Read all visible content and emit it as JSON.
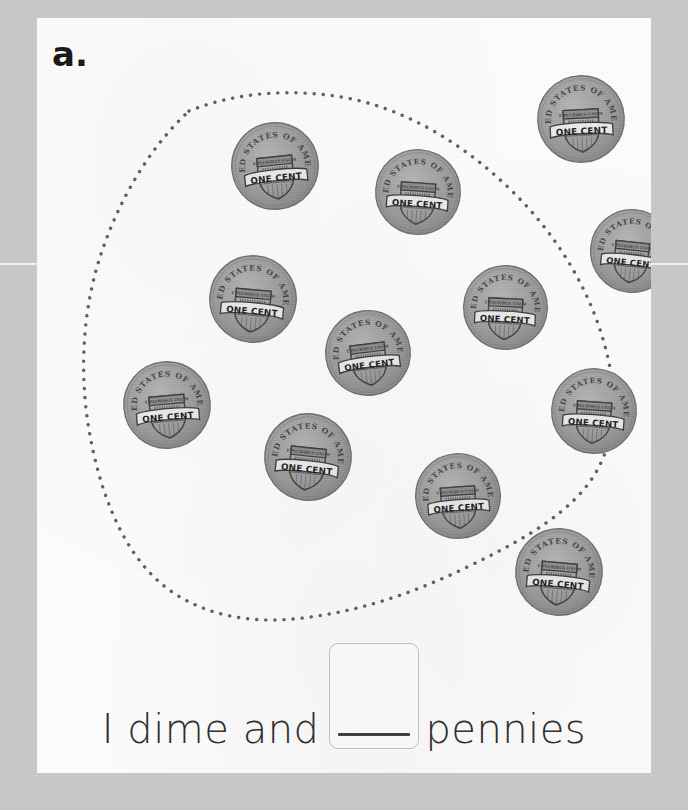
{
  "worksheet": {
    "item_label": "a.",
    "background_color": "#c8c8c8",
    "card_color": "#fdfdfd"
  },
  "grouping_loop": {
    "name": "dotted-grouping-loop",
    "style": "dotted",
    "dot_color": "#5d5d5d",
    "encloses_count": 10
  },
  "coins": {
    "denomination": "penny",
    "face": "reverse",
    "legend_top": "UNITED STATES OF AMERICA",
    "legend_shield": "E PLURIBUS UNUM",
    "legend_banner": "ONE CENT",
    "fill_color": "#9a9a9a",
    "ink_color": "#3c3c3c",
    "total_count": 12,
    "inside_loop_count": 10,
    "outside_loop_count": 2,
    "placements": [
      {
        "id": "coin-1",
        "x": 192,
        "y": 102,
        "size": 92,
        "rotate": -6,
        "inside_loop": true
      },
      {
        "id": "coin-2",
        "x": 336,
        "y": 129,
        "size": 90,
        "rotate": 4,
        "inside_loop": true
      },
      {
        "id": "coin-3",
        "x": 498,
        "y": 55,
        "size": 92,
        "rotate": -3,
        "inside_loop": false
      },
      {
        "id": "coin-4",
        "x": 551,
        "y": 189,
        "size": 88,
        "rotate": 6,
        "inside_loop": false
      },
      {
        "id": "coin-5",
        "x": 170,
        "y": 235,
        "size": 92,
        "rotate": 5,
        "inside_loop": true
      },
      {
        "id": "coin-6",
        "x": 286,
        "y": 290,
        "size": 90,
        "rotate": -7,
        "inside_loop": true
      },
      {
        "id": "coin-7",
        "x": 424,
        "y": 245,
        "size": 89,
        "rotate": 3,
        "inside_loop": true
      },
      {
        "id": "coin-8",
        "x": 84,
        "y": 341,
        "size": 92,
        "rotate": -5,
        "inside_loop": true
      },
      {
        "id": "coin-9",
        "x": 512,
        "y": 348,
        "size": 90,
        "rotate": 4,
        "inside_loop": true
      },
      {
        "id": "coin-10",
        "x": 225,
        "y": 393,
        "size": 92,
        "rotate": 6,
        "inside_loop": true
      },
      {
        "id": "coin-11",
        "x": 376,
        "y": 433,
        "size": 90,
        "rotate": -4,
        "inside_loop": true
      },
      {
        "id": "coin-12",
        "x": 476,
        "y": 508,
        "size": 92,
        "rotate": 5,
        "inside_loop": true
      }
    ]
  },
  "answer_sentence": {
    "lead_text": "I dime and",
    "trailing_text": "pennies",
    "answer_box": {
      "value": "",
      "placeholder": "",
      "has_write_on_line": true,
      "border_color": "#c3c3c3",
      "line_color": "#3a3a3a"
    }
  }
}
